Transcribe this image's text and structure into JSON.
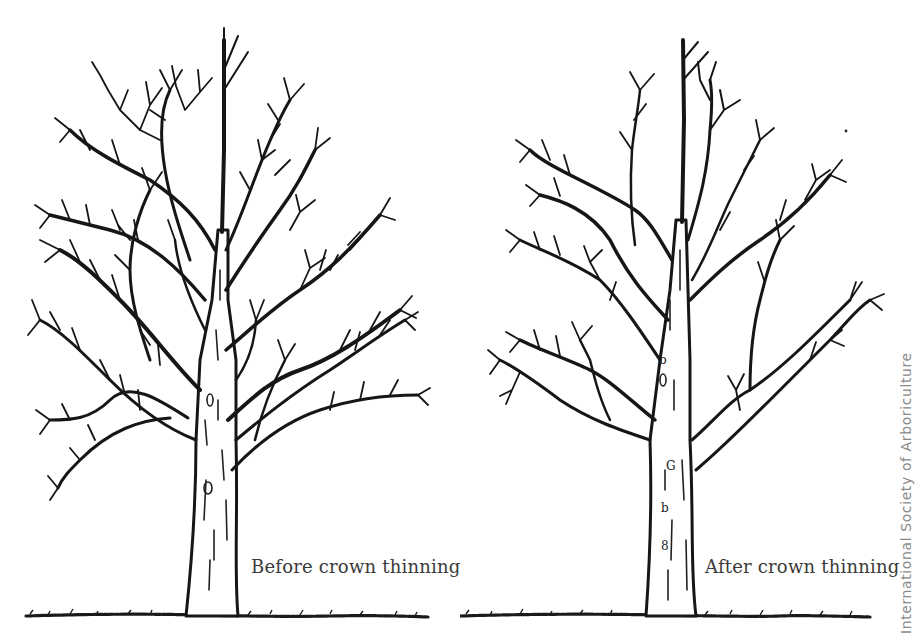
{
  "figure": {
    "panels": [
      {
        "id": "before",
        "caption": "Before crown thinning",
        "state": "dense crown, many crossing branches"
      },
      {
        "id": "after",
        "caption": "After crown thinning",
        "state": "thinned crown, fewer branches"
      }
    ],
    "credit": "International Society of Arboriculture",
    "colors": {
      "ink": "#161616",
      "background": "#ffffff",
      "caption": "#3a3a3a",
      "credit": "#8a8a8a"
    }
  }
}
